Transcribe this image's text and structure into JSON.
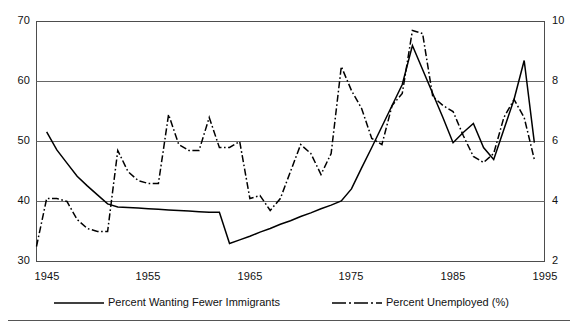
{
  "chart_data": {
    "type": "line",
    "title": "",
    "xlabel": "",
    "ylabel": "",
    "y2label": "",
    "grid": true,
    "legend_position": "bottom",
    "xlim": [
      1945,
      1995
    ],
    "ylim": [
      30,
      70
    ],
    "y2lim": [
      2,
      10
    ],
    "x_ticks": [
      "1945",
      "1955",
      "1965",
      "1975",
      "1985",
      "1995"
    ],
    "x_tick_values": [
      1945,
      1955,
      1965,
      1975,
      1985,
      1995
    ],
    "y_ticks": [
      "30",
      "40",
      "50",
      "60",
      "70"
    ],
    "y_tick_values": [
      30,
      40,
      50,
      60,
      70
    ],
    "y2_ticks": [
      "2",
      "4",
      "6",
      "8",
      "10"
    ],
    "y2_tick_values": [
      2,
      4,
      6,
      8,
      10
    ],
    "series": [
      {
        "name": "Percent Wanting Fewer Immigrants",
        "axis": "left",
        "style": "solid",
        "color": "#000000",
        "points": [
          [
            1946,
            51.6
          ],
          [
            1947,
            48.6
          ],
          [
            1948,
            46.4
          ],
          [
            1949,
            44.2
          ],
          [
            1950,
            42.6
          ],
          [
            1951,
            41.1
          ],
          [
            1952,
            39.6
          ],
          [
            1953,
            39.1
          ],
          [
            1954,
            39.0
          ],
          [
            1955,
            38.9
          ],
          [
            1956,
            38.8
          ],
          [
            1957,
            38.7
          ],
          [
            1958,
            38.6
          ],
          [
            1959,
            38.5
          ],
          [
            1960,
            38.4
          ],
          [
            1961,
            38.3
          ],
          [
            1962,
            38.2
          ],
          [
            1963,
            38.2
          ],
          [
            1964,
            33.0
          ],
          [
            1965,
            33.6
          ],
          [
            1966,
            34.2
          ],
          [
            1967,
            34.9
          ],
          [
            1968,
            35.5
          ],
          [
            1969,
            36.2
          ],
          [
            1970,
            36.8
          ],
          [
            1971,
            37.5
          ],
          [
            1972,
            38.1
          ],
          [
            1973,
            38.8
          ],
          [
            1974,
            39.4
          ],
          [
            1975,
            40.1
          ],
          [
            1976,
            42.1
          ],
          [
            1977,
            45.6
          ],
          [
            1978,
            49.0
          ],
          [
            1979,
            52.5
          ],
          [
            1980,
            56.0
          ],
          [
            1981,
            59.5
          ],
          [
            1982,
            66.0
          ],
          [
            1983,
            62.0
          ],
          [
            1984,
            58.0
          ],
          [
            1985,
            54.0
          ],
          [
            1986,
            49.8
          ],
          [
            1987,
            51.5
          ],
          [
            1988,
            53.0
          ],
          [
            1989,
            49.0
          ],
          [
            1990,
            47.0
          ],
          [
            1991,
            52.0
          ],
          [
            1992,
            57.0
          ],
          [
            1993,
            63.5
          ],
          [
            1994,
            49.8
          ]
        ]
      },
      {
        "name": "Percent Unemployed (%)",
        "axis": "right",
        "style": "dashdot",
        "color": "#000000",
        "points": [
          [
            1945,
            2.5
          ],
          [
            1946,
            4.1
          ],
          [
            1947,
            4.1
          ],
          [
            1948,
            4.0
          ],
          [
            1949,
            3.4
          ],
          [
            1950,
            3.1
          ],
          [
            1951,
            3.0
          ],
          [
            1952,
            3.0
          ],
          [
            1953,
            5.7
          ],
          [
            1954,
            5.0
          ],
          [
            1955,
            4.7
          ],
          [
            1956,
            4.6
          ],
          [
            1957,
            4.6
          ],
          [
            1958,
            6.9
          ],
          [
            1959,
            5.9
          ],
          [
            1960,
            5.7
          ],
          [
            1961,
            5.7
          ],
          [
            1962,
            6.8
          ],
          [
            1963,
            5.8
          ],
          [
            1964,
            5.8
          ],
          [
            1965,
            6.0
          ],
          [
            1966,
            4.1
          ],
          [
            1967,
            4.2
          ],
          [
            1968,
            3.7
          ],
          [
            1969,
            4.1
          ],
          [
            1970,
            5.0
          ],
          [
            1971,
            5.9
          ],
          [
            1972,
            5.6
          ],
          [
            1973,
            4.9
          ],
          [
            1974,
            5.6
          ],
          [
            1975,
            8.5
          ],
          [
            1976,
            7.7
          ],
          [
            1977,
            7.1
          ],
          [
            1978,
            6.1
          ],
          [
            1979,
            5.9
          ],
          [
            1980,
            7.2
          ],
          [
            1981,
            7.6
          ],
          [
            1982,
            9.7
          ],
          [
            1983,
            9.6
          ],
          [
            1984,
            7.5
          ],
          [
            1985,
            7.2
          ],
          [
            1986,
            7.0
          ],
          [
            1987,
            6.2
          ],
          [
            1988,
            5.5
          ],
          [
            1989,
            5.3
          ],
          [
            1990,
            5.6
          ],
          [
            1991,
            6.8
          ],
          [
            1992,
            7.4
          ],
          [
            1993,
            6.8
          ],
          [
            1994,
            5.4
          ]
        ]
      }
    ]
  },
  "axes": {
    "y_left": {
      "ticks": [
        "70",
        "60",
        "50",
        "40",
        "30"
      ]
    },
    "y_right": {
      "ticks": [
        "10",
        "8",
        "6",
        "4",
        "2"
      ]
    },
    "x": {
      "ticks": [
        "1945",
        "1955",
        "1965",
        "1975",
        "1985",
        "1995"
      ]
    }
  },
  "legend": {
    "items": [
      {
        "label": "Percent Wanting Fewer Immigrants",
        "style": "solid"
      },
      {
        "label": "Percent Unemployed (%)",
        "style": "dashdot"
      }
    ]
  }
}
